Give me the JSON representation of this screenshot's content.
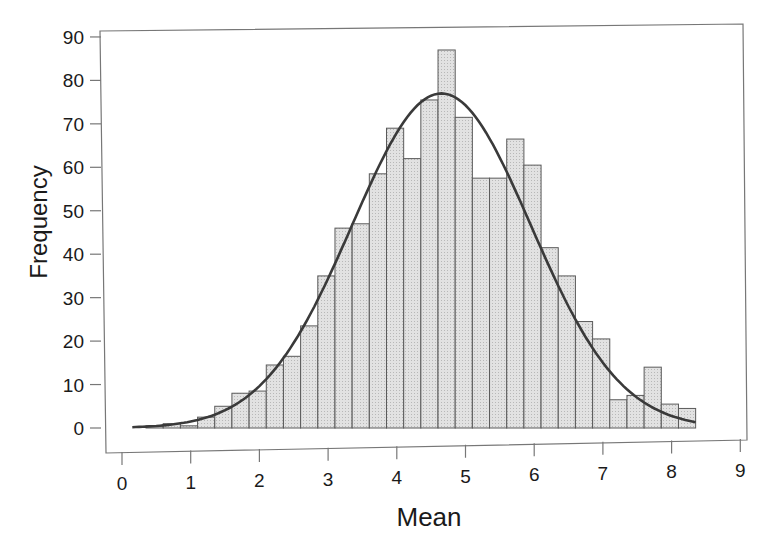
{
  "chart_data": {
    "type": "bar",
    "subtype": "histogram_with_normal_curve",
    "title": "",
    "xlabel": "Mean",
    "ylabel": "Frequency",
    "xlim": [
      0,
      9
    ],
    "ylim": [
      0,
      90
    ],
    "xticks": [
      0,
      1,
      2,
      3,
      4,
      5,
      6,
      7,
      8,
      9
    ],
    "yticks": [
      0,
      10,
      20,
      30,
      40,
      50,
      60,
      70,
      80,
      90
    ],
    "grid": false,
    "legend": null,
    "bin_start": 0.1,
    "bin_width": 0.25,
    "bins": [
      {
        "x0": 0.1,
        "x1": 0.35,
        "count": 0
      },
      {
        "x0": 0.35,
        "x1": 0.6,
        "count": 0.5
      },
      {
        "x0": 0.6,
        "x1": 0.85,
        "count": 1
      },
      {
        "x0": 0.85,
        "x1": 1.1,
        "count": 0.5
      },
      {
        "x0": 1.1,
        "x1": 1.35,
        "count": 2.5
      },
      {
        "x0": 1.35,
        "x1": 1.6,
        "count": 5
      },
      {
        "x0": 1.6,
        "x1": 1.85,
        "count": 8
      },
      {
        "x0": 1.85,
        "x1": 2.1,
        "count": 8.5
      },
      {
        "x0": 2.1,
        "x1": 2.35,
        "count": 14.5
      },
      {
        "x0": 2.35,
        "x1": 2.6,
        "count": 16.5
      },
      {
        "x0": 2.6,
        "x1": 2.85,
        "count": 23.5
      },
      {
        "x0": 2.85,
        "x1": 3.1,
        "count": 35
      },
      {
        "x0": 3.1,
        "x1": 3.35,
        "count": 46
      },
      {
        "x0": 3.35,
        "x1": 3.6,
        "count": 47
      },
      {
        "x0": 3.6,
        "x1": 3.85,
        "count": 58.5
      },
      {
        "x0": 3.85,
        "x1": 4.1,
        "count": 69
      },
      {
        "x0": 4.1,
        "x1": 4.35,
        "count": 62
      },
      {
        "x0": 4.35,
        "x1": 4.6,
        "count": 75.5
      },
      {
        "x0": 4.6,
        "x1": 4.85,
        "count": 87
      },
      {
        "x0": 4.85,
        "x1": 5.1,
        "count": 71.5
      },
      {
        "x0": 5.1,
        "x1": 5.35,
        "count": 57.5
      },
      {
        "x0": 5.35,
        "x1": 5.6,
        "count": 57.5
      },
      {
        "x0": 5.6,
        "x1": 5.85,
        "count": 66.5
      },
      {
        "x0": 5.85,
        "x1": 6.1,
        "count": 60.5
      },
      {
        "x0": 6.1,
        "x1": 6.35,
        "count": 41.5
      },
      {
        "x0": 6.35,
        "x1": 6.6,
        "count": 35
      },
      {
        "x0": 6.6,
        "x1": 6.85,
        "count": 24.5
      },
      {
        "x0": 6.85,
        "x1": 7.1,
        "count": 20.5
      },
      {
        "x0": 7.1,
        "x1": 7.35,
        "count": 6.5
      },
      {
        "x0": 7.35,
        "x1": 7.6,
        "count": 7.5
      },
      {
        "x0": 7.6,
        "x1": 7.85,
        "count": 14
      },
      {
        "x0": 7.85,
        "x1": 8.1,
        "count": 5.5
      },
      {
        "x0": 8.1,
        "x1": 8.35,
        "count": 4.5
      }
    ],
    "normal_curve": {
      "mean": 4.65,
      "sd": 1.3,
      "peak": 77,
      "x_range": [
        0.15,
        8.35
      ]
    }
  },
  "colors": {
    "bar_fill": "#d9d9d9",
    "bar_stroke": "#5a5a5a",
    "curve": "#3a3a3a",
    "axis": "#777777",
    "text": "#1a1a1a"
  }
}
